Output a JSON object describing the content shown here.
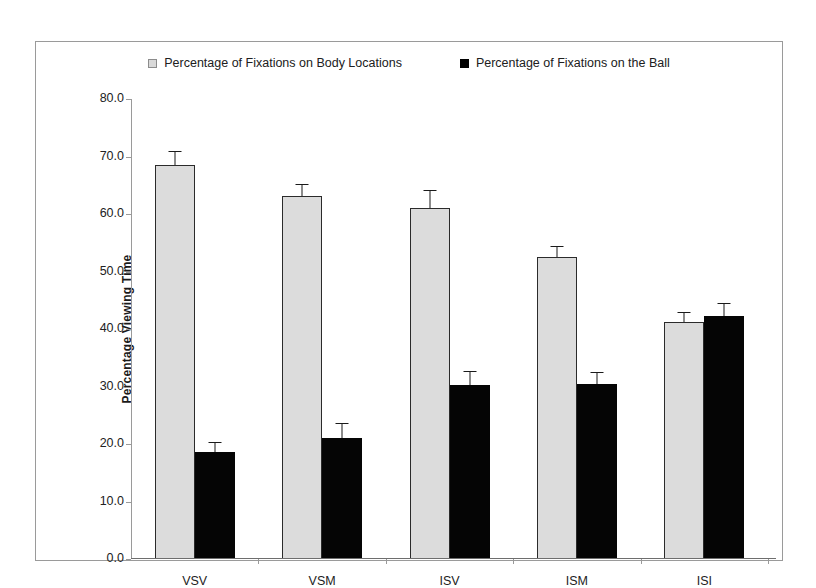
{
  "chart_data": {
    "type": "bar",
    "title": "",
    "xlabel": "Condition",
    "ylabel": "Percentage Viewing Time",
    "categories": [
      "VSV",
      "VSM",
      "ISV",
      "ISM",
      "ISI"
    ],
    "ylim": [
      0,
      80
    ],
    "yticks": [
      80.0,
      70.0,
      60.0,
      50.0,
      40.0,
      30.0,
      20.0,
      10.0,
      0.0
    ],
    "ytick_labels": [
      "80.0",
      "70.0",
      "60.0",
      "50.0",
      "40.0",
      "30.0",
      "20.0",
      "10.0",
      "0.0"
    ],
    "grid": false,
    "legend_position": "top-center",
    "series": [
      {
        "name": "Percentage of Fixations on Body Locations",
        "color": "#dcdcdc",
        "edge_color": "#2b2b2b",
        "values": [
          68.5,
          63.2,
          61.0,
          52.5,
          41.3
        ],
        "errors": [
          2.3,
          1.8,
          3.0,
          1.8,
          1.5
        ]
      },
      {
        "name": "Percentage of Fixations on the Ball",
        "color": "#050505",
        "edge_color": "#050505",
        "values": [
          18.6,
          21.1,
          30.2,
          30.4,
          42.2
        ],
        "errors": [
          1.6,
          2.3,
          2.3,
          2.0,
          2.2
        ]
      }
    ]
  },
  "legend": {
    "entries": [
      {
        "label": "Percentage of Fixations on Body Locations",
        "swatch": "light-square-marker"
      },
      {
        "label": "Percentage of Fixations on the Ball",
        "swatch": "black-square-marker"
      }
    ]
  }
}
